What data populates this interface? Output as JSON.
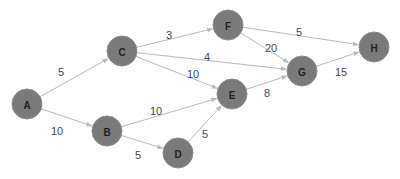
{
  "diagram": {
    "type": "directed-weighted-graph",
    "colors": {
      "node_fill": "#7a7a7a",
      "edge": "#b9b9b9",
      "label_text": "#4a4a4a",
      "node_text": "#222222"
    },
    "nodes": [
      {
        "id": "A",
        "label": "A",
        "x": 27,
        "y": 104
      },
      {
        "id": "B",
        "label": "B",
        "x": 107,
        "y": 131
      },
      {
        "id": "C",
        "label": "C",
        "x": 122,
        "y": 51
      },
      {
        "id": "D",
        "label": "D",
        "x": 178,
        "y": 153
      },
      {
        "id": "E",
        "label": "E",
        "x": 232,
        "y": 94
      },
      {
        "id": "F",
        "label": "F",
        "x": 228,
        "y": 25
      },
      {
        "id": "G",
        "label": "G",
        "x": 302,
        "y": 71
      },
      {
        "id": "H",
        "label": "H",
        "x": 374,
        "y": 47
      }
    ],
    "edges": [
      {
        "from": "A",
        "to": "C",
        "weight": "5",
        "lx": 61,
        "ly": 72
      },
      {
        "from": "A",
        "to": "B",
        "weight": "10",
        "lx": 57,
        "ly": 131
      },
      {
        "from": "C",
        "to": "F",
        "weight": "3",
        "lx": 169,
        "ly": 35
      },
      {
        "from": "C",
        "to": "G",
        "weight": "4",
        "lx": 207,
        "ly": 57
      },
      {
        "from": "C",
        "to": "E",
        "weight": "10",
        "lx": 193,
        "ly": 74
      },
      {
        "from": "B",
        "to": "E",
        "weight": "10",
        "lx": 156,
        "ly": 111
      },
      {
        "from": "B",
        "to": "D",
        "weight": "5",
        "lx": 138,
        "ly": 155
      },
      {
        "from": "D",
        "to": "E",
        "weight": "5",
        "lx": 205,
        "ly": 134
      },
      {
        "from": "F",
        "to": "H",
        "weight": "5",
        "lx": 299,
        "ly": 32
      },
      {
        "from": "F",
        "to": "G",
        "weight": "20",
        "lx": 271,
        "ly": 48
      },
      {
        "from": "E",
        "to": "G",
        "weight": "8",
        "lx": 267,
        "ly": 93
      },
      {
        "from": "G",
        "to": "H",
        "weight": "15",
        "lx": 341,
        "ly": 72
      }
    ]
  }
}
